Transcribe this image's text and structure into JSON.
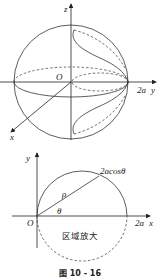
{
  "figure": {
    "caption": "图 10 - 16",
    "top": {
      "axis_z": "z",
      "axis_y": "y",
      "axis_x": "x",
      "origin": "O",
      "y_mark": "2a"
    },
    "bottom": {
      "axis_y": "y",
      "axis_x": "x",
      "origin": "O",
      "x_mark": "2a",
      "curve_label": "2acosθ",
      "rho": "ρ",
      "theta": "θ",
      "region_note": "区域放大"
    }
  }
}
